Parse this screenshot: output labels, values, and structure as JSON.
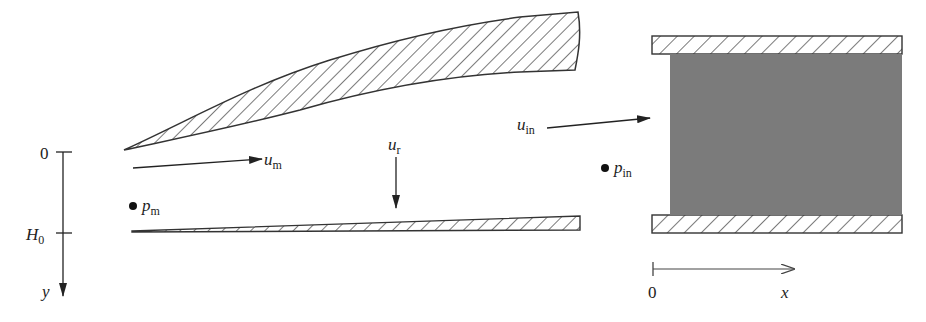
{
  "figure": {
    "kind": "channel flow schematic",
    "colors": {
      "stroke": "#333333",
      "fill_region": "#7a7a7a",
      "background": "#ffffff"
    }
  },
  "y_axis": {
    "label": "y",
    "ticks": [
      {
        "label": "0"
      },
      {
        "label_main": "H",
        "label_sub": "0"
      }
    ]
  },
  "x_axis": {
    "label": "x",
    "origin_label": "0"
  },
  "labels": {
    "u_m": {
      "main": "u",
      "sub": "m"
    },
    "p_m": {
      "main": "p",
      "sub": "m"
    },
    "u_r": {
      "main": "u",
      "sub": "r"
    },
    "u_in": {
      "main": "u",
      "sub": "in"
    },
    "p_in": {
      "main": "p",
      "sub": "in"
    }
  }
}
